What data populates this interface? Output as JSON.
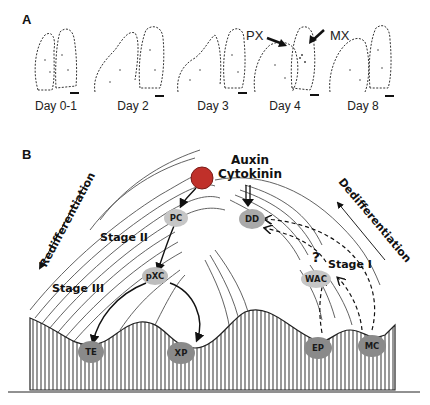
{
  "panel_a": {
    "label": "A",
    "days": [
      {
        "label": "Day 0-1"
      },
      {
        "label": "Day 2"
      },
      {
        "label": "Day 3"
      },
      {
        "label": "Day 4"
      },
      {
        "label": "Day 8"
      }
    ],
    "annotations": {
      "px": "PX",
      "mx": "MX"
    }
  },
  "panel_b": {
    "label": "B",
    "hormones": {
      "line1": "Auxin",
      "line2": "Cytokinin"
    },
    "stages": {
      "stage1": "Stage I",
      "stage2": "Stage II",
      "stage3": "Stage III"
    },
    "directions": {
      "left": "Redifferentiation",
      "right": "Dedifferentiation"
    },
    "question_mark": "?",
    "cells": {
      "pc": "PC",
      "dd": "DD",
      "wac": "WAC",
      "pxc": "pXC",
      "te": "TE",
      "xp": "XP",
      "ep": "EP",
      "mc": "MC"
    },
    "colors": {
      "cell_light": "#bdbdbd",
      "cell_dark": "#8a8a8a",
      "ball": "#c0302a",
      "lines": "#222222"
    }
  }
}
